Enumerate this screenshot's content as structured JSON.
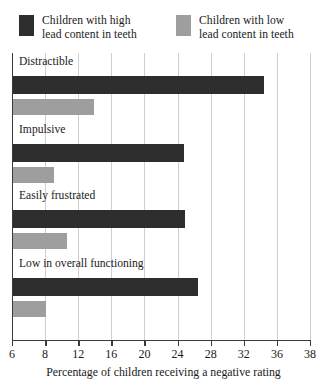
{
  "chart_data": {
    "type": "bar",
    "orientation": "horizontal",
    "title": "",
    "xlabel": "Percentage of children receiving a negative rating",
    "ylabel": "",
    "categories": [
      "Distractible",
      "Impulsive",
      "Easily frustrated",
      "Low in overall functioning"
    ],
    "series": [
      {
        "name": "Children with high\nlead content in teeth",
        "color": "#2e2e2e",
        "values": [
          34.3,
          24.6,
          24.8,
          26.3
        ]
      },
      {
        "name": "Children with low\nlead content in teeth",
        "color": "#9e9e9e",
        "values": [
          13.8,
          9.0,
          10.5,
          8.0
        ]
      }
    ],
    "xlim": [
      6,
      38
    ],
    "xticks": [
      6,
      8,
      12,
      16,
      20,
      24,
      28,
      32,
      36,
      38
    ],
    "xtick_labels": [
      "6",
      "8",
      "12",
      "16",
      "20",
      "24",
      "28",
      "32",
      "36",
      "38"
    ],
    "grid": "vertical",
    "legend_position": "top"
  },
  "legend": {
    "entries": [
      {
        "label": "Children with high\nlead content in teeth",
        "color": "#2e2e2e"
      },
      {
        "label": "Children with low\nlead content in teeth",
        "color": "#9e9e9e"
      }
    ]
  },
  "axis": {
    "title": "Percentage of children receiving a negative rating",
    "tick_labels": [
      "6",
      "8",
      "12",
      "16",
      "20",
      "24",
      "28",
      "32",
      "36",
      "38"
    ]
  },
  "groups": [
    {
      "label": "Distractible",
      "high": 34.3,
      "low": 13.8
    },
    {
      "label": "Impulsive",
      "high": 24.6,
      "low": 9.0
    },
    {
      "label": "Easily frustrated",
      "high": 24.8,
      "low": 10.5
    },
    {
      "label": "Low in overall functioning",
      "high": 26.3,
      "low": 8.0
    }
  ],
  "colors": {
    "high": "#2e2e2e",
    "low": "#9e9e9e",
    "grid": "#cfcfcf",
    "axis": "#3a3a3a",
    "text": "#1a1a1a",
    "background": "#ffffff"
  }
}
